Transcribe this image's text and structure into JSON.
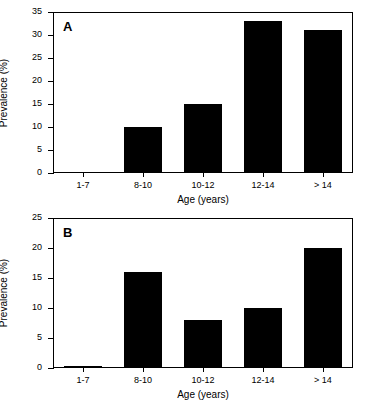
{
  "figure": {
    "background_color": "#ffffff",
    "bar_color": "#000000",
    "axis_color": "#000000"
  },
  "chart_data": [
    {
      "type": "bar",
      "panel_label": "A",
      "title": "",
      "categories": [
        "1-7",
        "8-10",
        "10-12",
        "12-14",
        "> 14"
      ],
      "values": [
        0.3,
        10,
        15,
        33,
        31
      ],
      "xlabel": "Age (years)",
      "ylabel": "Prevalence (%)",
      "ylim": [
        0,
        35
      ],
      "yticks": [
        0,
        5,
        10,
        15,
        20,
        25,
        30,
        35
      ],
      "ytick_labels": [
        "0",
        "5",
        "10",
        "15",
        "20",
        "25",
        "30",
        "35"
      ],
      "grid": false,
      "legend": "none"
    },
    {
      "type": "bar",
      "panel_label": "B",
      "title": "",
      "categories": [
        "1-7",
        "8-10",
        "10-12",
        "12-14",
        "> 14"
      ],
      "values": [
        0.3,
        16,
        8,
        10,
        20
      ],
      "xlabel": "Age (years)",
      "ylabel": "Prevalence (%)",
      "ylim": [
        0,
        25
      ],
      "yticks": [
        0,
        5,
        10,
        15,
        20,
        25
      ],
      "ytick_labels": [
        "0",
        "5",
        "10",
        "15",
        "20",
        "25"
      ],
      "grid": false,
      "legend": "none"
    }
  ]
}
